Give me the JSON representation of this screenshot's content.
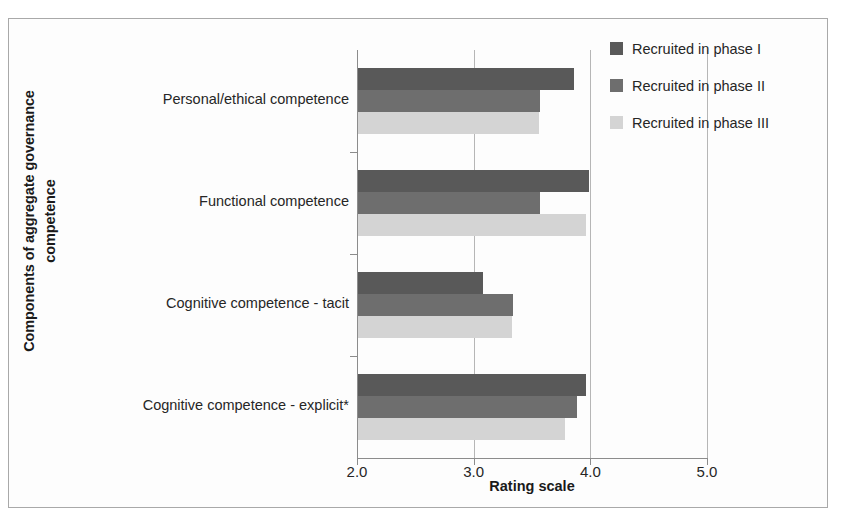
{
  "chart_data": {
    "type": "bar",
    "orientation": "horizontal",
    "title": "",
    "xlabel": "Rating scale",
    "ylabel": "Components of aggregate governance competence",
    "ylabel_lines": [
      "Components of aggregate governance",
      "competence"
    ],
    "categories": [
      "Personal/ethical competence",
      "Functional competence",
      "Cognitive competence - tacit",
      "Cognitive competence - explicit*"
    ],
    "series": [
      {
        "name": "Recruited in phase I",
        "color": "#595959",
        "values": [
          3.85,
          3.98,
          3.07,
          3.95
        ]
      },
      {
        "name": "Recruited in phase II",
        "color": "#6e6e6e",
        "values": [
          3.56,
          3.56,
          3.33,
          3.88
        ]
      },
      {
        "name": "Recruited in phase III",
        "color": "#d4d4d4",
        "values": [
          3.55,
          3.95,
          3.32,
          3.77
        ]
      }
    ],
    "xlim": [
      2.0,
      5.0
    ],
    "xticks": [
      2.0,
      3.0,
      4.0,
      5.0
    ],
    "xtick_labels": [
      "2.0",
      "3.0",
      "4.0",
      "5.0"
    ],
    "grid": true,
    "gridlines_at": [
      3.0,
      4.0,
      5.0
    ],
    "legend_position": "top-right",
    "legend": [
      "Recruited in phase I",
      "Recruited in phase II",
      "Recruited in phase III"
    ]
  },
  "colors": {
    "series_1": "#595959",
    "series_2": "#6e6e6e",
    "series_3": "#d4d4d4",
    "axis": "#8c8c8c",
    "gridline": "#b6b6b6",
    "frame": "#a9a9a9",
    "text": "#262626"
  }
}
